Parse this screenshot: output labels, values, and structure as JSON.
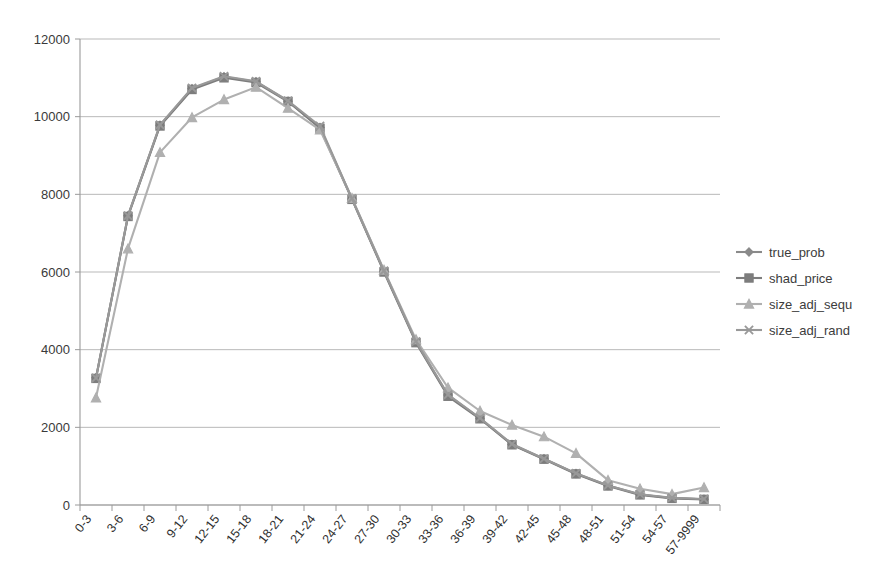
{
  "chart_data": {
    "type": "line",
    "title": "",
    "subtitle": "",
    "xlabel": "",
    "ylabel": "",
    "ylim": [
      0,
      12000
    ],
    "ytick_step": 2000,
    "yticks": [
      "0",
      "2000",
      "4000",
      "6000",
      "8000",
      "10000",
      "12000"
    ],
    "ytick_values": [
      0,
      2000,
      4000,
      6000,
      8000,
      10000,
      12000
    ],
    "grid": true,
    "legend_position": "right",
    "categories": [
      "0-3",
      "3-6",
      "6-9",
      "9-12",
      "12-15",
      "15-18",
      "18-21",
      "21-24",
      "24-27",
      "27-30",
      "30-33",
      "33-36",
      "36-39",
      "39-42",
      "42-45",
      "45-48",
      "48-51",
      "51-54",
      "54-57",
      "57-9999"
    ],
    "series": [
      {
        "name": "true_prob",
        "marker": "diamond",
        "color": "#8a8a8a",
        "values": [
          3280,
          7450,
          9780,
          10720,
          11030,
          10900,
          10400,
          9720,
          7880,
          6020,
          4200,
          2830,
          2230,
          1560,
          1190,
          810,
          500,
          270,
          180,
          150
        ]
      },
      {
        "name": "shad_price",
        "marker": "square",
        "color": "#7d7d7d",
        "values": [
          3260,
          7430,
          9760,
          10700,
          11000,
          10880,
          10390,
          9700,
          7870,
          6000,
          4180,
          2800,
          2220,
          1550,
          1180,
          800,
          490,
          260,
          170,
          145
        ]
      },
      {
        "name": "size_adj_sequ",
        "marker": "triangle",
        "color": "#b0b0b0",
        "values": [
          2760,
          6600,
          9080,
          9980,
          10440,
          10760,
          10220,
          9660,
          7900,
          6050,
          4260,
          3020,
          2420,
          2060,
          1760,
          1330,
          640,
          420,
          280,
          450
        ]
      },
      {
        "name": "size_adj_rand",
        "marker": "cross",
        "color": "#999999",
        "values": [
          3270,
          7450,
          9790,
          10740,
          11040,
          10910,
          10410,
          9760,
          7890,
          6030,
          4210,
          2840,
          2240,
          1570,
          1190,
          815,
          505,
          275,
          185,
          155
        ]
      }
    ]
  },
  "legend": {
    "entries": [
      {
        "label": "true_prob"
      },
      {
        "label": "shad_price"
      },
      {
        "label": "size_adj_sequ"
      },
      {
        "label": "size_adj_rand"
      }
    ]
  },
  "colors": {
    "gridline": "#b9b9b9",
    "axis": "#9a9a9a",
    "text": "#3a3a3a",
    "background": "#ffffff"
  }
}
